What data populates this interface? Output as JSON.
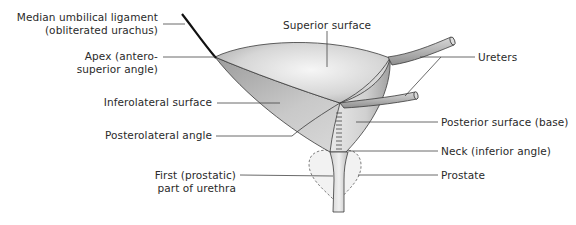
{
  "diagram": {
    "labels_left": [
      {
        "id": "median-umbilical-ligament",
        "line1": "Median umbilical ligament",
        "line2": "(obliterated urachus)"
      },
      {
        "id": "apex",
        "line1": "Apex (antero-",
        "line2": "superior angle)"
      },
      {
        "id": "inferolateral-surface",
        "line1": "Inferolateral surface"
      },
      {
        "id": "posterolateral-angle",
        "line1": "Posterolateral angle"
      },
      {
        "id": "first-part-urethra",
        "line1": "First (prostatic)",
        "line2": "part of urethra"
      }
    ],
    "labels_top": [
      {
        "id": "superior-surface",
        "line1": "Superior surface"
      }
    ],
    "labels_right": [
      {
        "id": "ureters",
        "line1": "Ureters"
      },
      {
        "id": "posterior-surface",
        "line1": "Posterior surface (base)"
      },
      {
        "id": "neck",
        "line1": "Neck (inferior angle)"
      },
      {
        "id": "prostate",
        "line1": "Prostate"
      }
    ],
    "colors": {
      "bladder_light": "#f2f2f2",
      "bladder_dark": "#9a9a9a",
      "outline": "#3a3a3a",
      "leader_line": "#444444",
      "ligament": "#111111",
      "prostate_fill": "#f3f3f3",
      "text": "#2a2a2a"
    }
  }
}
